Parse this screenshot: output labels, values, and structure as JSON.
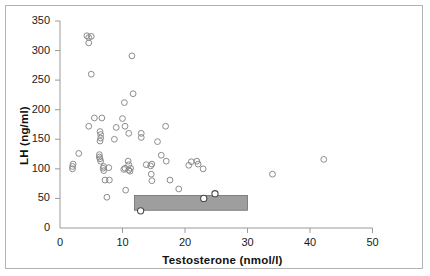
{
  "figure": {
    "background": "#ffffff",
    "frame_color": "#b3b3b3"
  },
  "chart_data": {
    "type": "scatter",
    "title": "",
    "xlabel": "Testosterone (nmol/l)",
    "ylabel": "LH (ng/ml)",
    "xlim": [
      0,
      52
    ],
    "ylim": [
      0,
      355
    ],
    "xticks": [
      0,
      10,
      20,
      30,
      40,
      50
    ],
    "yticks": [
      0,
      50,
      100,
      150,
      200,
      250,
      300,
      350
    ],
    "xticklabels": [
      "0",
      "10",
      "20",
      "30",
      "40",
      "50"
    ],
    "yticklabels": [
      "0",
      "50",
      "100",
      "150",
      "200",
      "250",
      "300",
      "350"
    ],
    "grid": false,
    "legend": null,
    "marker": "open-circle",
    "marker_color": "#8c8c8c",
    "points": [
      [
        2.0,
        104
      ],
      [
        2.0,
        100
      ],
      [
        2.1,
        108
      ],
      [
        3.0,
        126
      ],
      [
        4.3,
        325
      ],
      [
        4.6,
        322
      ],
      [
        4.6,
        313
      ],
      [
        5.0,
        324
      ],
      [
        5.0,
        260
      ],
      [
        4.6,
        172
      ],
      [
        5.5,
        186
      ],
      [
        6.3,
        120
      ],
      [
        6.4,
        117
      ],
      [
        6.5,
        113
      ],
      [
        6.3,
        124
      ],
      [
        6.4,
        163
      ],
      [
        6.5,
        158
      ],
      [
        6.5,
        152
      ],
      [
        6.4,
        147
      ],
      [
        6.7,
        186
      ],
      [
        6.9,
        101
      ],
      [
        7.0,
        104
      ],
      [
        7.0,
        97
      ],
      [
        7.2,
        81
      ],
      [
        7.9,
        81
      ],
      [
        7.5,
        52
      ],
      [
        7.8,
        102
      ],
      [
        8.7,
        150
      ],
      [
        9.0,
        170
      ],
      [
        10.0,
        185
      ],
      [
        10.3,
        212
      ],
      [
        10.4,
        172
      ],
      [
        10.2,
        99
      ],
      [
        10.4,
        101
      ],
      [
        10.9,
        113
      ],
      [
        11.0,
        107
      ],
      [
        11.0,
        160
      ],
      [
        11.0,
        98
      ],
      [
        11.2,
        96
      ],
      [
        11.3,
        101
      ],
      [
        11.5,
        291
      ],
      [
        11.7,
        227
      ],
      [
        10.5,
        64
      ],
      [
        12.9,
        29
      ],
      [
        13.0,
        153
      ],
      [
        13.0,
        160
      ],
      [
        13.8,
        107
      ],
      [
        14.5,
        105
      ],
      [
        14.7,
        108
      ],
      [
        14.6,
        91
      ],
      [
        14.7,
        80
      ],
      [
        15.6,
        146
      ],
      [
        16.2,
        123
      ],
      [
        16.9,
        172
      ],
      [
        17.0,
        113
      ],
      [
        17.6,
        81
      ],
      [
        19.0,
        66
      ],
      [
        20.6,
        106
      ],
      [
        21.0,
        112
      ],
      [
        21.9,
        113
      ],
      [
        22.1,
        108
      ],
      [
        22.9,
        100
      ],
      [
        23.0,
        50
      ],
      [
        24.8,
        58
      ],
      [
        34.0,
        91
      ],
      [
        42.2,
        116
      ]
    ],
    "reference_box": {
      "label": "normal-range-box",
      "x_start": 11.9,
      "x_end": 30.0,
      "y_start": 30,
      "y_end": 55,
      "fill": "#9e9e9e",
      "stroke": "#6e6e6e"
    },
    "highlighted_points": [
      [
        12.9,
        29
      ],
      [
        23.0,
        50
      ],
      [
        24.8,
        58
      ]
    ]
  }
}
